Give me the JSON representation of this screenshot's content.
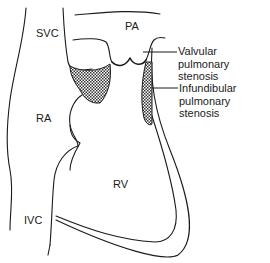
{
  "diagram": {
    "title": "Pulmonary stenosis",
    "structures": [
      {
        "id": "svc",
        "label": "SVC"
      },
      {
        "id": "pa",
        "label": "PA"
      },
      {
        "id": "ra",
        "label": "RA"
      },
      {
        "id": "rv",
        "label": "RV"
      },
      {
        "id": "ivc",
        "label": "IVC"
      }
    ],
    "annotations": [
      {
        "id": "valvular",
        "line1": "Valvular pulmonary",
        "line2": "stenosis"
      },
      {
        "id": "infundibular",
        "line1": "Infundibular",
        "line2": "pulmonary",
        "line3": "stenosis"
      }
    ],
    "colors": {
      "stroke": "#1a1a1a",
      "hatch": "#555555",
      "background": "#ffffff"
    }
  }
}
